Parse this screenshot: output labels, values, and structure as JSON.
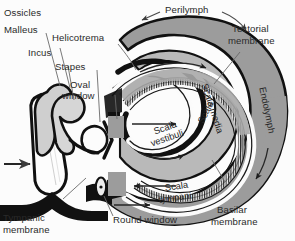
{
  "figure": {
    "background_color": "#fcfcfc",
    "fill_gray": "#9c9c9c",
    "fill_gray_light": "#bdbdbd",
    "outline_color": "#111111",
    "text_color": "#2a2a2a"
  },
  "labels": {
    "ossicles": "Ossicles",
    "malleus": "Malleus",
    "incus": "Incus",
    "stapes": "Stapes",
    "helicotrema": "Helicotrema",
    "oval_window_l1": "Oval",
    "oval_window_l2": "window",
    "perilymph": "Perilymph",
    "tectorial_l1": "Tectorial",
    "tectorial_l2": "membrane",
    "endolymph": "Endolymph",
    "scala_media": "Scala media",
    "scala_vestibuli_l1": "Scala",
    "scala_vestibuli_l2": "vestibuli",
    "scala_tympani_l1": "Scala",
    "scala_tympani_l2": "tympani",
    "basilar_l1": "Basilar",
    "basilar_l2": "membrane",
    "round_window": "Round window",
    "tympanic_l1": "Tympanic",
    "tympanic_l2": "membrane"
  },
  "icons": {
    "sound_input_arrow": "arrow-right-icon",
    "flow_arrow": "arrow-flow-icon",
    "leader_line": "leader-line-icon"
  }
}
